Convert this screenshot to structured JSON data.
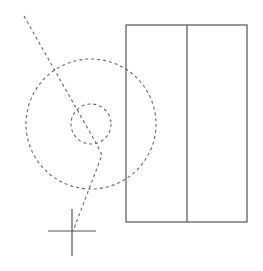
{
  "diagram": {
    "width": 263,
    "height": 271,
    "background": "#ffffff",
    "colors": {
      "solid_stroke": "#555555",
      "dashed_stroke": "#666666",
      "crosshair_stroke": "#555555"
    },
    "rectangle": {
      "x": 126,
      "y": 25,
      "width": 121,
      "height": 197,
      "divider_x": 187
    },
    "outer_circle": {
      "cx": 91,
      "cy": 124,
      "r": 65
    },
    "inner_circle": {
      "cx": 91,
      "cy": 124,
      "r": 20
    },
    "dashed_path": {
      "points": [
        [
          24,
          16
        ],
        [
          96,
          143
        ],
        [
          102,
          155
        ],
        [
          73,
          231
        ]
      ]
    },
    "crosshair": {
      "cx": 72,
      "cy": 231,
      "h_from": 48,
      "h_to": 96,
      "v_from": 209,
      "v_to": 256
    }
  }
}
